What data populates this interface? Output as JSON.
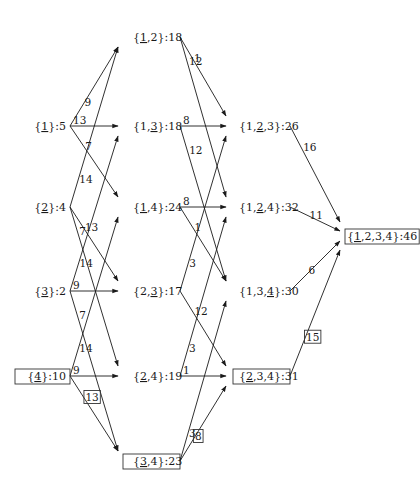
{
  "diagram": {
    "type": "subset-lattice-dp",
    "nodes": [
      {
        "id": "n1",
        "label": "{1}:5",
        "set": "1",
        "underline": "1",
        "value": 5,
        "x": 70,
        "y": 126,
        "anchor": "end",
        "boxed": false
      },
      {
        "id": "n2",
        "label": "{2}:4",
        "set": "2",
        "underline": "2",
        "value": 4,
        "x": 70,
        "y": 207,
        "anchor": "end",
        "boxed": false
      },
      {
        "id": "n3",
        "label": "{3}:2",
        "set": "3",
        "underline": "3",
        "value": 2,
        "x": 70,
        "y": 291,
        "anchor": "end",
        "boxed": false
      },
      {
        "id": "n4",
        "label": "{4}:10",
        "set": "4",
        "underline": "4",
        "value": 10,
        "x": 70,
        "y": 376,
        "anchor": "end",
        "boxed": true
      },
      {
        "id": "n12",
        "label": "{1,2}:18",
        "set": "1,2",
        "underline": "1",
        "value": 18,
        "x": 133,
        "y": 37,
        "anchor": "start",
        "boxed": false
      },
      {
        "id": "n13",
        "label": "{1,3}:18",
        "set": "1,3",
        "underline": "3",
        "value": 18,
        "x": 133,
        "y": 126,
        "anchor": "start",
        "boxed": false
      },
      {
        "id": "n14",
        "label": "{1,4}:24",
        "set": "1,4",
        "underline": "1",
        "value": 24,
        "x": 133,
        "y": 207,
        "anchor": "start",
        "boxed": false
      },
      {
        "id": "n23",
        "label": "{2,3}:17",
        "set": "2,3",
        "underline": "3",
        "value": 17,
        "x": 133,
        "y": 291,
        "anchor": "start",
        "boxed": false
      },
      {
        "id": "n24",
        "label": "{2,4}:19",
        "set": "2,4",
        "underline": "2",
        "value": 19,
        "x": 133,
        "y": 376,
        "anchor": "start",
        "boxed": false
      },
      {
        "id": "n34",
        "label": "{3,4}:23",
        "set": "3,4",
        "underline": "3",
        "value": 23,
        "x": 133,
        "y": 461,
        "anchor": "start",
        "boxed": true
      },
      {
        "id": "n123",
        "label": "{1,2,3}:26",
        "set": "1,2,3",
        "underline": "2",
        "value": 26,
        "x": 239,
        "y": 126,
        "anchor": "start",
        "boxed": false
      },
      {
        "id": "n124",
        "label": "{1,2,4}:32",
        "set": "1,2,4",
        "underline": "2",
        "value": 32,
        "x": 239,
        "y": 207,
        "anchor": "start",
        "boxed": false
      },
      {
        "id": "n134",
        "label": "{1,3,4}:30",
        "set": "1,3,4",
        "underline": "4",
        "value": 30,
        "x": 239,
        "y": 291,
        "anchor": "start",
        "boxed": false
      },
      {
        "id": "n234",
        "label": "{2,3,4}:31",
        "set": "2,3,4",
        "underline": "2",
        "value": 31,
        "x": 239,
        "y": 376,
        "anchor": "start",
        "boxed": true
      },
      {
        "id": "n1234",
        "label": "{1,2,3,4}:46",
        "set": "1,2,3,4",
        "underline": "1",
        "value": 46,
        "x": 347,
        "y": 236,
        "anchor": "start",
        "boxed": true
      }
    ],
    "edges": [
      {
        "from": "n1",
        "to": "n12",
        "weight": "9",
        "boxed": false
      },
      {
        "from": "n1",
        "to": "n13",
        "weight": "13",
        "boxed": false
      },
      {
        "from": "n1",
        "to": "n14",
        "weight": "7",
        "boxed": false
      },
      {
        "from": "n2",
        "to": "n12",
        "weight": "14",
        "boxed": false
      },
      {
        "from": "n2",
        "to": "n23",
        "weight": "13",
        "boxed": false
      },
      {
        "from": "n2",
        "to": "n24",
        "weight": "7",
        "boxed": false
      },
      {
        "from": "n3",
        "to": "n13",
        "weight": "14",
        "boxed": false
      },
      {
        "from": "n3",
        "to": "n23",
        "weight": "9",
        "boxed": false
      },
      {
        "from": "n3",
        "to": "n34",
        "weight": "7",
        "boxed": false
      },
      {
        "from": "n4",
        "to": "n14",
        "weight": "14",
        "boxed": false
      },
      {
        "from": "n4",
        "to": "n24",
        "weight": "9",
        "boxed": false
      },
      {
        "from": "n4",
        "to": "n34",
        "weight": "13",
        "boxed": true
      },
      {
        "from": "n12",
        "to": "n123",
        "weight": "1",
        "boxed": false
      },
      {
        "from": "n12",
        "to": "n124",
        "weight": "12",
        "boxed": false
      },
      {
        "from": "n13",
        "to": "n123",
        "weight": "8",
        "boxed": false
      },
      {
        "from": "n13",
        "to": "n134",
        "weight": "12",
        "boxed": false
      },
      {
        "from": "n14",
        "to": "n124",
        "weight": "8",
        "boxed": false
      },
      {
        "from": "n14",
        "to": "n134",
        "weight": "1",
        "boxed": false
      },
      {
        "from": "n23",
        "to": "n123",
        "weight": "3",
        "boxed": false
      },
      {
        "from": "n23",
        "to": "n234",
        "weight": "12",
        "boxed": false
      },
      {
        "from": "n24",
        "to": "n124",
        "weight": "3",
        "boxed": false
      },
      {
        "from": "n24",
        "to": "n234",
        "weight": "1",
        "boxed": false
      },
      {
        "from": "n34",
        "to": "n134",
        "weight": "3",
        "boxed": false
      },
      {
        "from": "n34",
        "to": "n234",
        "weight": "8",
        "boxed": true
      },
      {
        "from": "n123",
        "to": "n1234",
        "weight": "16",
        "boxed": false
      },
      {
        "from": "n124",
        "to": "n1234",
        "weight": "11",
        "boxed": false
      },
      {
        "from": "n134",
        "to": "n1234",
        "weight": "6",
        "boxed": false
      },
      {
        "from": "n234",
        "to": "n1234",
        "weight": "15",
        "boxed": true
      }
    ],
    "optimal_path": [
      "n4",
      "n34",
      "n234",
      "n1234"
    ]
  }
}
